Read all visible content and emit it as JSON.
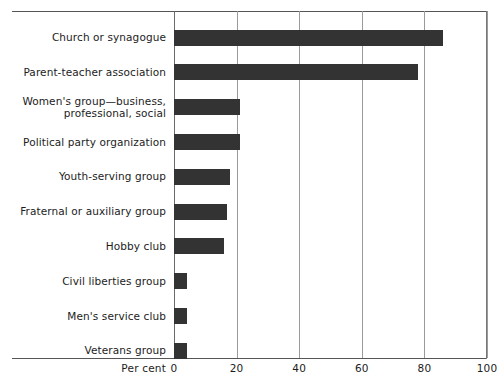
{
  "chart_data": {
    "type": "bar",
    "orientation": "horizontal",
    "title": "",
    "xlabel": "Per cent",
    "ylabel": "",
    "xlim": [
      0,
      100
    ],
    "xticks": [
      0,
      20,
      40,
      60,
      80,
      100
    ],
    "xtick_labels": [
      "0",
      "20",
      "40",
      "60",
      "80",
      "100"
    ],
    "grid": "vertical",
    "legend": "none",
    "bar_color": "#333333",
    "categories": [
      "Church or synagogue",
      "Parent-teacher association",
      "Women's group—business,\nprofessional, social",
      "Political party organization",
      "Youth-serving group",
      "Fraternal or auxiliary group",
      "Hobby club",
      "Civil liberties group",
      "Men's service club",
      "Veterans group"
    ],
    "values": [
      86,
      78,
      21,
      21,
      18,
      17,
      16,
      4,
      4,
      4
    ]
  },
  "axis": {
    "caption": "Per cent"
  }
}
